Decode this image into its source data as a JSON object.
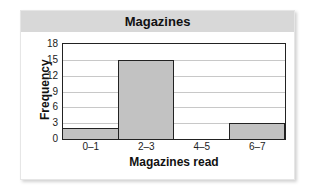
{
  "chart_data": {
    "type": "bar",
    "title": "Magazines",
    "xlabel": "Magazines read",
    "ylabel": "Frequency",
    "categories": [
      "0–1",
      "2–3",
      "4–5",
      "6–7"
    ],
    "values": [
      2,
      15,
      0,
      3
    ],
    "ylim": [
      0,
      18
    ],
    "yticks": [
      0,
      3,
      6,
      9,
      12,
      15,
      18
    ],
    "grid": true,
    "histogram": true,
    "bar_color": "#c2c2c2",
    "header_color": "#d8d8d8"
  },
  "labels": {
    "title": "Magazines",
    "xlabel": "Magazines read",
    "ylabel": "Frequency",
    "yticks": [
      "0",
      "3",
      "6",
      "9",
      "12",
      "15",
      "18"
    ],
    "xticks": [
      "0–1",
      "2–3",
      "4–5",
      "6–7"
    ]
  }
}
